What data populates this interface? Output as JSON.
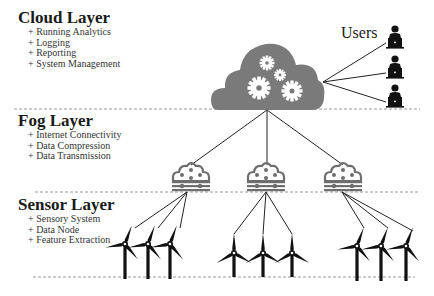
{
  "layers": [
    {
      "title": "Cloud Layer",
      "items": [
        "+ Running Analytics",
        "+ Logging",
        "+ Reporting",
        "+ System Management"
      ]
    },
    {
      "title": "Fog Layer",
      "items": [
        "+ Internet Connectivity",
        "+ Data Compression",
        "+ Data Transmission"
      ]
    },
    {
      "title": "Sensor Layer",
      "items": [
        "+ Sensory System",
        "+ Data Node",
        "+ Feature Extraction"
      ]
    }
  ],
  "users_label": "Users",
  "icons": {
    "cloud": "cloud-gears-icon",
    "user": "user-laptop-icon",
    "fog_node": "fog-node-icon",
    "sensor": "wind-turbine-icon"
  },
  "colors": {
    "cloud_fill": "#7a7a7a",
    "fog_node": "#6e6e6e",
    "turbine": "#111111",
    "user": "#111111",
    "separator": "#9a9a9a",
    "link": "#222222"
  },
  "counts": {
    "users": 3,
    "fog_nodes": 3,
    "turbines_per_fog_node": 3
  }
}
